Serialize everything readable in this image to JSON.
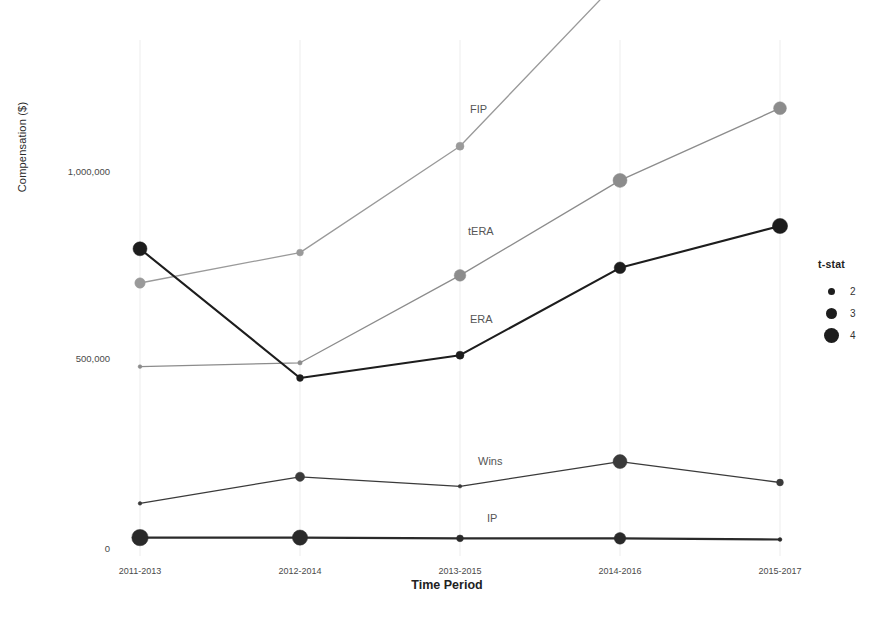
{
  "chart_data": {
    "type": "line",
    "title": "",
    "xlabel": "Time Period",
    "ylabel": "Compensation ($)",
    "categories": [
      "2011-2013",
      "2012-2014",
      "2013-2015",
      "2014-2016",
      "2015-2017"
    ],
    "ytick_labels": [
      "0",
      "500,000",
      "1,000,000"
    ],
    "ytick_values": [
      0,
      500000,
      1000000
    ],
    "ylim": [
      0,
      1600000
    ],
    "grid": false,
    "legend": {
      "title": "t-stat",
      "position": "right",
      "entries": [
        {
          "label": "2",
          "size_px": 7
        },
        {
          "label": "3",
          "size_px": 11
        },
        {
          "label": "4",
          "size_px": 15
        }
      ]
    },
    "series": [
      {
        "name": "FIP",
        "color": "#9a9a9a",
        "values": [
          700000,
          780000,
          1060000,
          1500000,
          1500000
        ],
        "t_stat": [
          3.0,
          2.4,
          2.6,
          4.0,
          4.0
        ]
      },
      {
        "name": "tERA",
        "color": "#8c8c8c",
        "values": [
          480000,
          490000,
          720000,
          970000,
          1160000
        ],
        "t_stat": [
          1.9,
          2.0,
          3.2,
          3.6,
          3.4
        ]
      },
      {
        "name": "ERA",
        "color": "#1d1d1d",
        "values": [
          790000,
          450000,
          510000,
          740000,
          850000
        ],
        "t_stat": [
          3.6,
          2.4,
          2.6,
          3.2,
          3.8
        ]
      },
      {
        "name": "Wins",
        "color": "#3a3a3a",
        "values": [
          120000,
          190000,
          165000,
          230000,
          175000
        ],
        "t_stat": [
          1.8,
          2.8,
          1.8,
          3.6,
          2.4
        ]
      },
      {
        "name": "IP",
        "color": "#2a2a2a",
        "values": [
          30000,
          30000,
          28000,
          28000,
          25000
        ],
        "t_stat": [
          4.0,
          3.8,
          2.4,
          3.2,
          1.9
        ]
      }
    ]
  }
}
